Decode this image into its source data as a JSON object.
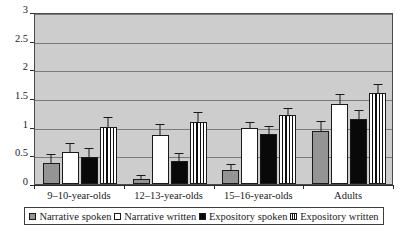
{
  "chart_data": {
    "type": "bar",
    "title": "",
    "subtitle": "",
    "xlabel": "",
    "ylabel": "",
    "categories": [
      "9–10-year-olds",
      "12–13-year-olds",
      "15–16-year-olds",
      "Adults"
    ],
    "series": [
      {
        "name": "Narrative spoken",
        "style": "gray",
        "values": [
          0.36,
          0.09,
          0.25,
          0.93
        ],
        "errors": [
          0.15,
          0.05,
          0.09,
          0.15
        ]
      },
      {
        "name": "Narrative written",
        "style": "white",
        "values": [
          0.55,
          0.86,
          0.97,
          1.4
        ],
        "errors": [
          0.14,
          0.17,
          0.09,
          0.16
        ]
      },
      {
        "name": "Expository spoken",
        "style": "black",
        "values": [
          0.47,
          0.41,
          0.88,
          1.13
        ],
        "errors": [
          0.14,
          0.12,
          0.11,
          0.15
        ]
      },
      {
        "name": "Expository written",
        "style": "stripe",
        "values": [
          1.0,
          1.08,
          1.2,
          1.58
        ],
        "errors": [
          0.16,
          0.16,
          0.1,
          0.14
        ]
      }
    ],
    "ylim": [
      0,
      3
    ],
    "yticks": [
      "0",
      "0.5",
      "1",
      "1.5",
      "2",
      "2.5",
      "3"
    ],
    "ytick_values": [
      0,
      0.5,
      1,
      1.5,
      2,
      2.5,
      3
    ],
    "grid": true,
    "legend_position": "bottom",
    "plot_background": "#cdcdcd",
    "colors": {
      "gray": "#949494",
      "white": "#ffffff",
      "black": "#090909",
      "stripe": "#ffffff",
      "gridline": "#7a7a7a",
      "axis": "#2a2a2a"
    }
  },
  "legend": {
    "items": [
      {
        "label": "Narrative spoken",
        "style": "gray"
      },
      {
        "label": "Narrative written",
        "style": "white"
      },
      {
        "label": "Expository spoken",
        "style": "black"
      },
      {
        "label": "Expository written",
        "style": "stripe"
      }
    ]
  }
}
